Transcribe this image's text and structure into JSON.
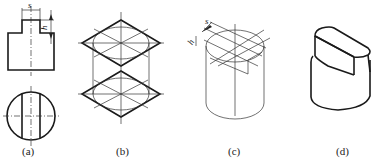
{
  "figure": {
    "panels": [
      {
        "id": "a",
        "label": "(a)",
        "description": "Orthographic views: front view with slot step, top view circle with two vertical lines",
        "dimensions": [
          "s",
          "h"
        ]
      },
      {
        "id": "b",
        "label": "(b)",
        "description": "Isometric construction: two rhombi with inscribed ellipses and diagonal construction lines"
      },
      {
        "id": "c",
        "label": "(c)",
        "description": "Isometric cylinder with slot construction lines",
        "dimensions": [
          "s",
          "h"
        ]
      },
      {
        "id": "d",
        "label": "(d)",
        "description": "Finished isometric view of slotted cylinder"
      }
    ],
    "dim_s": "s",
    "dim_h": "h"
  }
}
